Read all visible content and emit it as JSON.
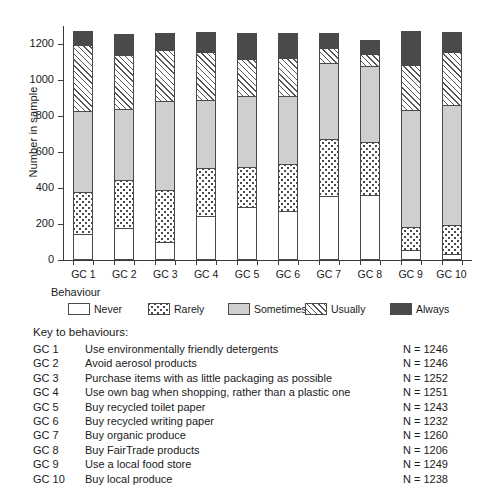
{
  "chart_data": {
    "type": "bar",
    "subtype": "stacked-bar",
    "title": "",
    "xlabel": "",
    "ylabel": "Number in sample",
    "ylim": [
      0,
      1300
    ],
    "yticks": [
      0,
      200,
      400,
      600,
      800,
      1000,
      1200
    ],
    "ytick_labels": [
      "0",
      "200",
      "400",
      "600",
      "800",
      "1000",
      "1200"
    ],
    "grid": false,
    "legend_title": "Behaviour",
    "legend_position": "below-axes",
    "categories": [
      "GC 1",
      "GC 2",
      "GC 3",
      "GC 4",
      "GC 5",
      "GC 6",
      "GC 7",
      "GC 8",
      "GC 9",
      "GC 10"
    ],
    "series": [
      {
        "name": "Never",
        "fill": "white",
        "values": [
          144,
          178,
          100,
          244,
          294,
          272,
          356,
          361,
          55,
          33
        ]
      },
      {
        "name": "Rarely",
        "fill": "dotted",
        "values": [
          233,
          267,
          289,
          267,
          222,
          261,
          317,
          294,
          128,
          161
        ]
      },
      {
        "name": "Sometimes",
        "fill": "grey",
        "values": [
          450,
          394,
          494,
          378,
          394,
          378,
          422,
          422,
          650,
          667
        ]
      },
      {
        "name": "Usually",
        "fill": "hatched",
        "values": [
          367,
          300,
          283,
          267,
          206,
          211,
          83,
          67,
          250,
          294
        ]
      },
      {
        "name": "Always",
        "fill": "black",
        "values": [
          78,
          117,
          94,
          111,
          144,
          139,
          83,
          78,
          189,
          111
        ]
      }
    ],
    "totals": [
      1272,
      1256,
      1260,
      1267,
      1260,
      1261,
      1261,
      1222,
      1272,
      1266
    ],
    "sample_sizes": [
      1246,
      1246,
      1252,
      1251,
      1243,
      1232,
      1260,
      1206,
      1249,
      1238
    ]
  },
  "axes": {
    "ylabel": "Number in sample",
    "ytick_labels": [
      "1200",
      "1000",
      "800",
      "600",
      "400",
      "200",
      "0"
    ],
    "xtick_labels": [
      "GC 1",
      "GC 2",
      "GC 3",
      "GC 4",
      "GC 5",
      "GC 6",
      "GC 7",
      "GC 8",
      "GC 9",
      "GC 10"
    ]
  },
  "legend": {
    "title": "Behaviour",
    "items": [
      {
        "label": "Never",
        "swatch": "white-swatch"
      },
      {
        "label": "Rarely",
        "swatch": "dotted-swatch"
      },
      {
        "label": "Sometimes",
        "swatch": "grey-swatch"
      },
      {
        "label": "Usually",
        "swatch": "hatched-swatch"
      },
      {
        "label": "Always",
        "swatch": "black-swatch"
      }
    ]
  },
  "key": {
    "title": "Key to behaviours:",
    "rows": [
      {
        "code": "GC 1",
        "description": "Use environmentally friendly detergents",
        "n": "N = 1246"
      },
      {
        "code": "GC 2",
        "description": "Avoid aerosol products",
        "n": "N = 1246"
      },
      {
        "code": "GC 3",
        "description": "Purchase items with as little packaging as possible",
        "n": "N = 1252"
      },
      {
        "code": "GC 4",
        "description": "Use own bag when shopping, rather than a plastic one",
        "n": "N = 1251"
      },
      {
        "code": "GC 5",
        "description": "Buy recycled toilet paper",
        "n": "N = 1243"
      },
      {
        "code": "GC 6",
        "description": "Buy recycled writing paper",
        "n": "N = 1232"
      },
      {
        "code": "GC 7",
        "description": "Buy organic produce",
        "n": "N = 1260"
      },
      {
        "code": "GC 8",
        "description": "Buy FairTrade products",
        "n": "N = 1206"
      },
      {
        "code": "GC 9",
        "description": "Use a local food store",
        "n": "N = 1249"
      },
      {
        "code": "GC 10",
        "description": "Buy local produce",
        "n": "N = 1238"
      }
    ]
  },
  "colors": {
    "axis": "#3b3b3b",
    "outline": "#4a4a4a",
    "sometimes_grey": "#cfcfcf",
    "always_black": "#4a4a4a",
    "background": "#ffffff"
  }
}
